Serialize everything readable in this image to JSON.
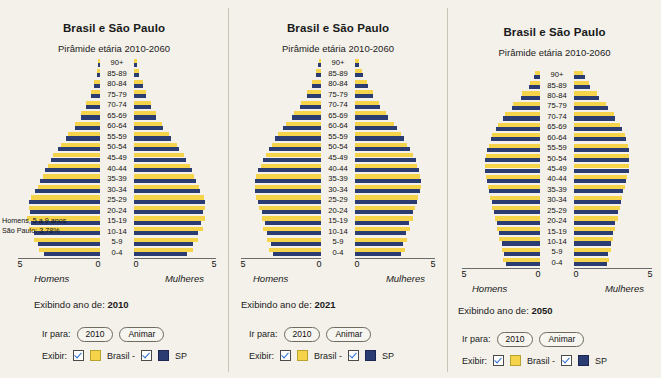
{
  "panels": [
    {
      "title": "Brasil e São Paulo",
      "subtitle": "Pirâmide etária 2010-2060",
      "year_label_prefix": "Exibindo ano de: ",
      "year_label_value": "2010",
      "goto_label": "Ir para:",
      "goto_value": "2010",
      "animate_label": "Animar",
      "show_label": "Exibir:",
      "legend_brasil": "Brasil -",
      "legend_sp": "SP",
      "axis_left_name": "Homens",
      "axis_right_name": "Mulheres",
      "annotation": [
        "Homens, 5 a 9 anos",
        "São Paulo: 3,78%"
      ],
      "show_age_labels": true,
      "chart_data": {
        "type": "bar",
        "orientation": "horizontal-pyramid",
        "title": "Brasil e São Paulo",
        "subtitle": "Pirâmide etária 2010-2060",
        "xlabel_left": "Homens",
        "xlabel_right": "Mulheres",
        "xlim": [
          0,
          5
        ],
        "xticks": [
          5,
          0,
          0,
          5
        ],
        "grid": false,
        "legend": [
          "Brasil",
          "SP"
        ],
        "categories": [
          "0-4",
          "5-9",
          "10-14",
          "15-19",
          "20-24",
          "25-29",
          "30-34",
          "35-39",
          "40-44",
          "45-49",
          "50-54",
          "55-59",
          "60-64",
          "65-69",
          "70-74",
          "75-79",
          "80-84",
          "85-89",
          "90+"
        ],
        "series": [
          {
            "name": "Brasil homens",
            "values": [
              3.75,
              4.05,
              4.35,
              4.45,
              4.35,
              4.2,
              3.8,
              3.5,
              3.2,
              2.85,
              2.4,
              1.95,
              1.5,
              1.15,
              0.85,
              0.58,
              0.38,
              0.2,
              0.12
            ]
          },
          {
            "name": "SP homens",
            "values": [
              3.4,
              3.78,
              4.05,
              4.2,
              4.25,
              4.3,
              3.95,
              3.65,
              3.35,
              3.0,
              2.55,
              2.05,
              1.55,
              1.15,
              0.85,
              0.58,
              0.38,
              0.2,
              0.12
            ]
          },
          {
            "name": "Brasil mulheres",
            "values": [
              3.6,
              3.9,
              4.2,
              4.35,
              4.35,
              4.25,
              3.95,
              3.65,
              3.4,
              3.05,
              2.6,
              2.15,
              1.7,
              1.35,
              1.05,
              0.75,
              0.52,
              0.3,
              0.2
            ]
          },
          {
            "name": "SP mulheres",
            "values": [
              3.25,
              3.6,
              3.9,
              4.1,
              4.2,
              4.3,
              4.05,
              3.8,
              3.55,
              3.2,
              2.75,
              2.25,
              1.75,
              1.35,
              1.05,
              0.75,
              0.52,
              0.3,
              0.2
            ]
          }
        ]
      }
    },
    {
      "title": "Brasil e São Paulo",
      "subtitle": "Pirâmide etária 2010-2060",
      "year_label_prefix": "Exibindo ano de: ",
      "year_label_value": "2021",
      "goto_label": "Ir para:",
      "goto_value": "2010",
      "animate_label": "Animar",
      "show_label": "Exibir:",
      "legend_brasil": "Brasil -",
      "legend_sp": "SP",
      "axis_left_name": "Homens",
      "axis_right_name": "Mulheres",
      "annotation": [],
      "show_age_labels": true,
      "chart_data": {
        "type": "bar",
        "orientation": "horizontal-pyramid",
        "title": "Brasil e São Paulo",
        "subtitle": "Pirâmide etária 2010-2060",
        "xlabel_left": "Homens",
        "xlabel_right": "Mulheres",
        "xlim": [
          0,
          5
        ],
        "xticks": [
          5,
          0,
          0,
          5
        ],
        "grid": false,
        "legend": [
          "Brasil",
          "SP"
        ],
        "categories": [
          "0-4",
          "5-9",
          "10-14",
          "15-19",
          "20-24",
          "25-29",
          "30-34",
          "35-39",
          "40-44",
          "45-49",
          "50-54",
          "55-59",
          "60-64",
          "65-69",
          "70-74",
          "75-79",
          "80-84",
          "85-89",
          "90+"
        ],
        "series": [
          {
            "name": "Brasil homens",
            "values": [
              3.25,
              3.4,
              3.6,
              3.7,
              3.85,
              4.05,
              4.15,
              4.05,
              3.75,
              3.45,
              3.05,
              2.7,
              2.2,
              1.7,
              1.25,
              0.85,
              0.55,
              0.3,
              0.15
            ]
          },
          {
            "name": "SP homens",
            "values": [
              3.0,
              3.15,
              3.35,
              3.5,
              3.7,
              3.95,
              4.15,
              4.15,
              3.95,
              3.65,
              3.25,
              2.85,
              2.35,
              1.8,
              1.3,
              0.88,
              0.58,
              0.32,
              0.16
            ]
          },
          {
            "name": "Brasil mulheres",
            "values": [
              3.1,
              3.25,
              3.45,
              3.6,
              3.75,
              3.95,
              4.1,
              4.05,
              3.85,
              3.6,
              3.25,
              2.9,
              2.45,
              1.95,
              1.5,
              1.1,
              0.75,
              0.45,
              0.25
            ]
          },
          {
            "name": "SP mulheres",
            "values": [
              2.85,
              3.0,
              3.2,
              3.4,
              3.6,
              3.85,
              4.05,
              4.1,
              4.0,
              3.8,
              3.45,
              3.05,
              2.6,
              2.05,
              1.55,
              1.15,
              0.8,
              0.48,
              0.28
            ]
          }
        ]
      }
    },
    {
      "title": "Brasil e São Paulo",
      "subtitle": "Pirâmide etária 2010-2060",
      "year_label_prefix": "Exibindo ano de: ",
      "year_label_value": "2050",
      "goto_label": "Ir para:",
      "goto_value": "2010",
      "animate_label": "Animar",
      "show_label": "Exibir:",
      "legend_brasil": "Brasil -",
      "legend_sp": "SP",
      "axis_left_name": "Homens",
      "axis_right_name": "Mulheres",
      "annotation": [],
      "show_age_labels": true,
      "chart_data": {
        "type": "bar",
        "orientation": "horizontal-pyramid",
        "title": "Brasil e São Paulo",
        "subtitle": "Pirâmide etária 2010-2060",
        "xlabel_left": "Homens",
        "xlabel_right": "Mulheres",
        "xlim": [
          0,
          5
        ],
        "xticks": [
          5,
          0,
          0,
          5
        ],
        "grid": false,
        "legend": [
          "Brasil",
          "SP"
        ],
        "categories": [
          "0-4",
          "5-9",
          "10-14",
          "15-19",
          "20-24",
          "25-29",
          "30-34",
          "35-39",
          "40-44",
          "45-49",
          "50-54",
          "55-59",
          "60-64",
          "65-69",
          "70-74",
          "75-79",
          "80-84",
          "85-89",
          "90+"
        ],
        "series": [
          {
            "name": "Brasil homens",
            "values": [
              2.35,
              2.45,
              2.6,
              2.75,
              2.9,
              3.05,
              3.2,
              3.35,
              3.45,
              3.5,
              3.45,
              3.3,
              3.05,
              2.7,
              2.25,
              1.7,
              1.15,
              0.65,
              0.35
            ]
          },
          {
            "name": "SP homens",
            "values": [
              2.2,
              2.3,
              2.45,
              2.6,
              2.75,
              2.95,
              3.1,
              3.25,
              3.4,
              3.5,
              3.5,
              3.4,
              3.15,
              2.8,
              2.35,
              1.8,
              1.2,
              0.7,
              0.38
            ]
          },
          {
            "name": "Brasil mulheres",
            "values": [
              2.25,
              2.35,
              2.5,
              2.65,
              2.8,
              2.95,
              3.1,
              3.25,
              3.4,
              3.5,
              3.5,
              3.45,
              3.25,
              2.95,
              2.55,
              2.05,
              1.5,
              0.95,
              0.6
            ]
          },
          {
            "name": "SP mulheres",
            "values": [
              2.1,
              2.2,
              2.35,
              2.5,
              2.65,
              2.85,
              3.0,
              3.15,
              3.35,
              3.5,
              3.55,
              3.5,
              3.35,
              3.05,
              2.65,
              2.15,
              1.6,
              1.05,
              0.68
            ]
          }
        ]
      }
    }
  ],
  "colors": {
    "brasil": "#f5d44b",
    "sp": "#2b3c73",
    "background": "#f4f1ea",
    "checkbox_check": "#2b6fd6"
  }
}
